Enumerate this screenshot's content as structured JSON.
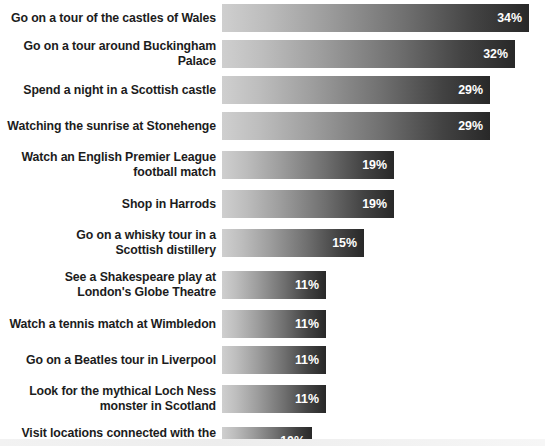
{
  "chart_data": {
    "type": "bar",
    "orientation": "horizontal",
    "title": "",
    "subtitle": "",
    "xlabel": "",
    "ylabel": "",
    "grid": false,
    "legend": null,
    "value_suffix": "%",
    "xlim": [
      0,
      34
    ],
    "categories": [
      "Go on a tour of the castles of Wales",
      "Go on a tour around Buckingham Palace",
      "Spend a night in a Scottish castle",
      "Watching the sunrise at Stonehenge",
      "Watch an English Premier League\nfootball match",
      "Shop in Harrods",
      "Go on a whisky tour in a\nScottish distillery",
      "See a Shakespeare play at\nLondon's Globe Theatre",
      "Watch a tennis match at Wimbledon",
      "Go on a Beatles tour in Liverpool",
      "Look for the mythical Loch Ness\nmonster in Scotland",
      "Visit locations connected with the\nHarry Potter films"
    ],
    "values": [
      34,
      32,
      29,
      29,
      19,
      19,
      15,
      11,
      11,
      11,
      11,
      10
    ],
    "value_labels": [
      "34%",
      "32%",
      "29%",
      "29%",
      "19%",
      "19%",
      "15%",
      "11%",
      "11%",
      "11%",
      "11%",
      "10%"
    ],
    "bar_pixel_widths": [
      307,
      293,
      268,
      268,
      172,
      172,
      142,
      104,
      104,
      104,
      104,
      90
    ],
    "bar_row_heights": [
      36,
      36,
      36,
      36,
      42,
      36,
      42,
      42,
      36,
      36,
      42,
      42
    ],
    "colors": {
      "bar_gradient_start": "#cfcfcf",
      "bar_gradient_end": "#282828",
      "label_text": "#1c1c1c",
      "value_text": "#ffffff",
      "background": "#ffffff",
      "bottom_band": "#f0f0f0"
    }
  }
}
